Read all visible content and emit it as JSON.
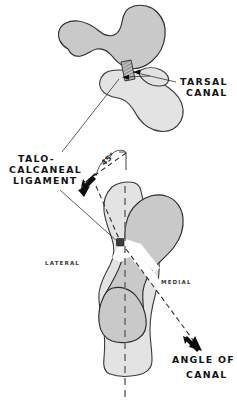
{
  "figure": {
    "background_color": "#ffffff",
    "ink_color": "#141414",
    "bone_fill_dark": "#c9c9c9",
    "bone_fill_light": "#e3e3e3",
    "bone_outline": "#2b2b2b",
    "axis_color": "#6a6a6a"
  },
  "labels": {
    "tarsal_canal": {
      "line1": "TARSAL",
      "line2": "CANAL"
    },
    "talo_calcaneal_ligament": {
      "line1": "TALO-",
      "line2": "CALCANEAL",
      "line3": "LIGAMENT"
    },
    "angle_of_canal": {
      "line1": "ANGLE OF",
      "line2": "CANAL"
    },
    "lateral": "LATERAL",
    "medial": "MEDIAL",
    "angle_value": "45°"
  },
  "measurements": {
    "canal_angle_degrees": "45°"
  },
  "icons": {
    "arrow_to_ligament": "arrow-down-left-icon",
    "arrow_to_angle": "arrow-down-right-icon"
  }
}
